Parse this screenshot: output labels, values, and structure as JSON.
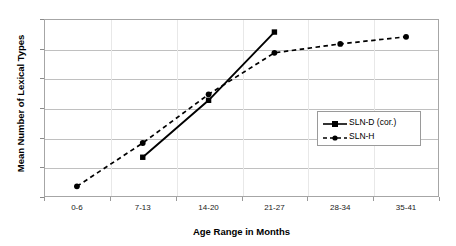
{
  "chart_data": {
    "type": "line",
    "title": "",
    "xlabel": "Age Range in Months",
    "ylabel": "Mean Number of Lexical Types",
    "categories": [
      "0-6",
      "7-13",
      "14-20",
      "21-27",
      "28-34",
      "35-41"
    ],
    "ylim": [
      0,
      300
    ],
    "yticks": [
      0,
      50,
      100,
      150,
      200,
      250,
      300
    ],
    "ytick_labels": [
      "0",
      "50",
      "100",
      "150",
      "200",
      "250",
      "300"
    ],
    "grid": true,
    "legend_position": "center-right",
    "series": [
      {
        "name": "SLN-D (cor.)",
        "line_style": "solid",
        "marker": "square",
        "color": "#000000",
        "values": [
          null,
          67,
          163,
          278,
          null,
          null
        ]
      },
      {
        "name": "SLN-H",
        "line_style": "dashed",
        "marker": "circle",
        "color": "#000000",
        "values": [
          18,
          91,
          173,
          243,
          258,
          270
        ]
      }
    ]
  },
  "legend": {
    "entries": [
      {
        "label": "SLN-D (cor.)"
      },
      {
        "label": "SLN-H"
      }
    ]
  },
  "axes": {
    "y_title": "Mean Number of Lexical Types",
    "x_title": "Age Range in Months"
  }
}
